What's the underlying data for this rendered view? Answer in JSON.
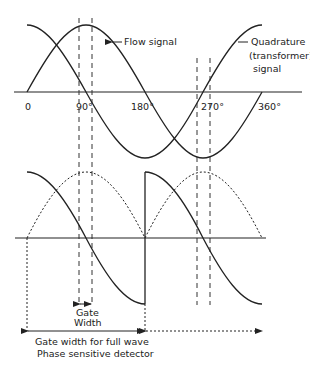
{
  "diagram": {
    "labels": {
      "flow_signal": "Flow signal",
      "quadrature_line1": "Quadrature",
      "quadrature_line2": "(transformer)",
      "quadrature_line3": "signal",
      "gate_line1": "Gate",
      "gate_line2": "Width",
      "full_wave_line1": "Gate width for full wave",
      "full_wave_line2": "Phase sensitive detector"
    },
    "axis_ticks": [
      "0",
      "90°",
      "180°",
      "270°",
      "360°"
    ]
  }
}
